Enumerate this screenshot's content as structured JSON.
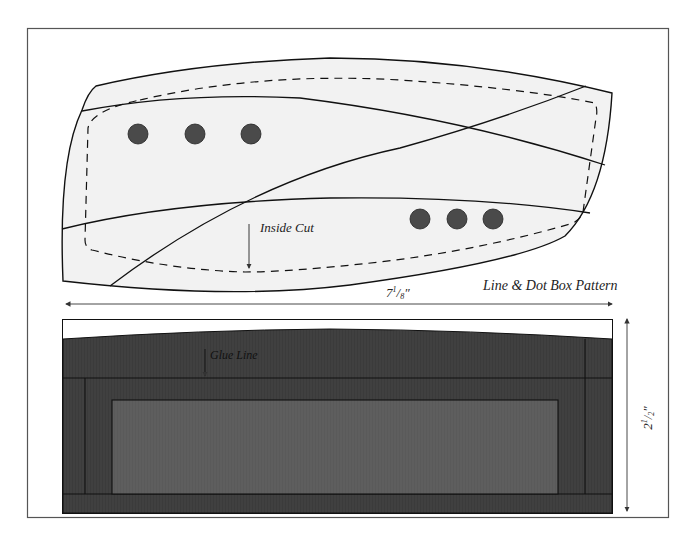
{
  "figure": {
    "title": "Line & Dot Box Pattern",
    "colors": {
      "background": "#ffffff",
      "frame": "#555555",
      "pattern_fill": "#f1f1f1",
      "line": "#111111",
      "dot": "#4a4a4a",
      "box_dark": "#3e3e3e",
      "box_mid": "#484848",
      "box_inner": "#5c5c5c"
    }
  },
  "top_view": {
    "annotation": "Inside Cut",
    "dots_left_count": 3,
    "dots_right_count": 3
  },
  "dimensions": {
    "width_label_main": "7",
    "width_label_num": "1",
    "width_label_den": "8",
    "width_label_unit": "″",
    "height_label_main": "2",
    "height_label_num": "1",
    "height_label_den": "2",
    "height_label_unit": "″"
  },
  "side_view": {
    "annotation": "Glue Line"
  }
}
